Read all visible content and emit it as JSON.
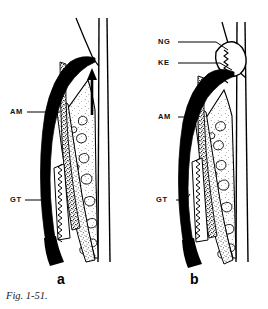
{
  "figure": {
    "caption": "Fig. 1-51.",
    "panels": [
      {
        "letter": "a",
        "labels": [
          {
            "key": "AM",
            "text": "AM"
          },
          {
            "key": "GT",
            "text": "GT"
          }
        ],
        "annotations": [
          {
            "name": "upward-arrow",
            "description": "arrow"
          }
        ]
      },
      {
        "letter": "b",
        "labels": [
          {
            "key": "NG",
            "text": "NG"
          },
          {
            "key": "KE",
            "text": "KE"
          },
          {
            "key": "AM",
            "text": "AM"
          },
          {
            "key": "GT",
            "text": "GT"
          }
        ],
        "annotations": []
      }
    ]
  },
  "colors": {
    "ink": "#000000",
    "background": "#ffffff",
    "stipple": "#2a2a2a",
    "caption": "#1a1a1a"
  }
}
